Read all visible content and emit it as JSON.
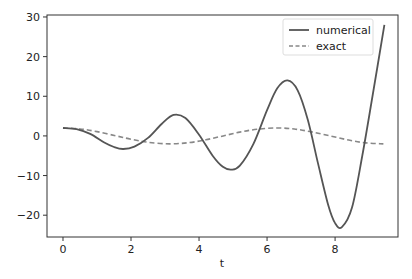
{
  "chart_data": {
    "type": "line",
    "title": "",
    "xlabel": "t",
    "ylabel": "",
    "xlim": [
      -0.47,
      9.85
    ],
    "ylim": [
      -25.5,
      30.5
    ],
    "xticks": [
      0,
      2,
      4,
      6,
      8
    ],
    "yticks": [
      -20,
      -10,
      0,
      10,
      20,
      30
    ],
    "grid": false,
    "legend_position": "upper right",
    "series": [
      {
        "name": "numerical",
        "style": "solid",
        "color": "#555555",
        "x": [
          0,
          0.4,
          0.8,
          1.2,
          1.5,
          1.77,
          2.1,
          2.5,
          2.9,
          3.25,
          3.6,
          4.0,
          4.4,
          4.7,
          4.95,
          5.2,
          5.6,
          6.0,
          6.3,
          6.6,
          6.9,
          7.2,
          7.5,
          7.8,
          8.0,
          8.2,
          8.5,
          8.8,
          9.1,
          9.45
        ],
        "y": [
          2,
          1.7,
          0.5,
          -1.6,
          -2.8,
          -3.3,
          -2.7,
          -0.5,
          3.0,
          5.3,
          4.5,
          0.3,
          -5.0,
          -7.8,
          -8.5,
          -7.5,
          -2.0,
          6.5,
          12.0,
          14.0,
          11.5,
          4.0,
          -7.0,
          -17.5,
          -22.0,
          -23.0,
          -18.0,
          -5.0,
          10.0,
          28.0
        ]
      },
      {
        "name": "exact",
        "style": "dashed",
        "color": "#888888",
        "x": [
          0,
          0.5,
          1.0,
          1.57,
          2.0,
          2.5,
          3.14,
          3.7,
          4.2,
          4.71,
          5.2,
          5.7,
          6.28,
          6.8,
          7.3,
          7.85,
          8.4,
          8.9,
          9.42
        ],
        "y": [
          2,
          1.76,
          1.08,
          0,
          -0.83,
          -1.6,
          -2,
          -1.7,
          -0.97,
          0,
          0.95,
          1.67,
          2,
          1.74,
          1.03,
          0,
          -1.04,
          -1.76,
          -2
        ]
      }
    ]
  }
}
